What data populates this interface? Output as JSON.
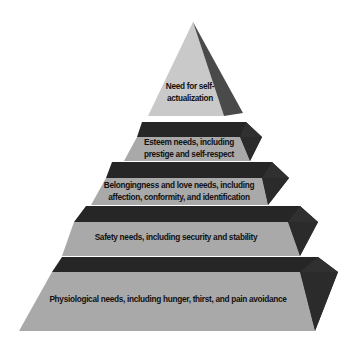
{
  "diagram": {
    "type": "pyramid",
    "title": "",
    "colors": {
      "apex_face": "#c9c9c9",
      "apex_side": "#4a4a4a",
      "tier_face": "#a9a9a9",
      "tier_top": "#262626",
      "tier_side": "#333333",
      "text": "#111111",
      "background": "#ffffff"
    },
    "tiers": [
      {
        "level": 5,
        "name": "self-actualization",
        "lines": [
          "Need for self-",
          "actualization"
        ]
      },
      {
        "level": 4,
        "name": "esteem",
        "lines": [
          "Esteem needs, including",
          "prestige and self-respect"
        ]
      },
      {
        "level": 3,
        "name": "belongingness",
        "lines": [
          "Belongingness and love needs, including",
          "affection, conformity, and identification"
        ]
      },
      {
        "level": 2,
        "name": "safety",
        "lines": [
          "Safety needs, including security and stability"
        ]
      },
      {
        "level": 1,
        "name": "physiological",
        "lines": [
          "Physiological needs, including hunger, thirst, and pain avoidance"
        ]
      }
    ]
  }
}
